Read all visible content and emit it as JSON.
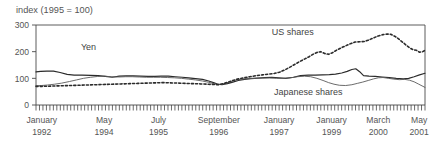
{
  "chart_data": {
    "type": "line",
    "title": "index (1995 = 100)",
    "xlabel": "",
    "ylabel": "",
    "ylim": [
      0,
      300
    ],
    "yticks": [
      0,
      100,
      200,
      300
    ],
    "ytick_labels": [
      "0",
      "100",
      "200",
      "300"
    ],
    "grid": false,
    "legend_position": "inline-annotations",
    "x_tick_labels": [
      {
        "month": "January",
        "year": "1992",
        "pos": 0.015
      },
      {
        "month": "May",
        "year": "1994",
        "pos": 0.175
      },
      {
        "month": "July",
        "year": "1995",
        "pos": 0.315
      },
      {
        "month": "September",
        "year": "1996",
        "pos": 0.47
      },
      {
        "month": "January",
        "year": "1997",
        "pos": 0.625
      },
      {
        "month": "January",
        "year": "1999",
        "pos": 0.76
      },
      {
        "month": "March",
        "year": "2000",
        "pos": 0.88
      },
      {
        "month": "May",
        "year": "2001",
        "pos": 0.985
      }
    ],
    "minor_tick_count": 113,
    "annotations": [
      {
        "text": "Yen",
        "x_frac": 0.135,
        "y_value": 205
      },
      {
        "text": "US shares",
        "x_frac": 0.66,
        "y_value": 262
      },
      {
        "text": "Japanese shares",
        "x_frac": 0.7,
        "y_value": 38
      }
    ],
    "series": [
      {
        "name": "Yen",
        "style": "solid",
        "color": "#2b2b2b",
        "width": 1.2,
        "values": [
          [
            0.0,
            124
          ],
          [
            0.012,
            126
          ],
          [
            0.028,
            127
          ],
          [
            0.045,
            127
          ],
          [
            0.062,
            122
          ],
          [
            0.08,
            115
          ],
          [
            0.098,
            112
          ],
          [
            0.118,
            112
          ],
          [
            0.14,
            111
          ],
          [
            0.16,
            110
          ],
          [
            0.178,
            107
          ],
          [
            0.196,
            104
          ],
          [
            0.214,
            108
          ],
          [
            0.232,
            109
          ],
          [
            0.25,
            109
          ],
          [
            0.268,
            108
          ],
          [
            0.288,
            107
          ],
          [
            0.306,
            107
          ],
          [
            0.322,
            108
          ],
          [
            0.34,
            108
          ],
          [
            0.358,
            106
          ],
          [
            0.376,
            104
          ],
          [
            0.392,
            102
          ],
          [
            0.41,
            99
          ],
          [
            0.428,
            96
          ],
          [
            0.444,
            90
          ],
          [
            0.458,
            83
          ],
          [
            0.468,
            78
          ],
          [
            0.478,
            76
          ],
          [
            0.492,
            80
          ],
          [
            0.506,
            86
          ],
          [
            0.52,
            92
          ],
          [
            0.536,
            96
          ],
          [
            0.552,
            99
          ],
          [
            0.57,
            101
          ],
          [
            0.588,
            103
          ],
          [
            0.606,
            104
          ],
          [
            0.624,
            102
          ],
          [
            0.642,
            100
          ],
          [
            0.662,
            104
          ],
          [
            0.68,
            110
          ],
          [
            0.7,
            112
          ],
          [
            0.718,
            112
          ],
          [
            0.736,
            113
          ],
          [
            0.754,
            114
          ],
          [
            0.77,
            116
          ],
          [
            0.786,
            120
          ],
          [
            0.8,
            126
          ],
          [
            0.812,
            133
          ],
          [
            0.822,
            136
          ],
          [
            0.832,
            125
          ],
          [
            0.842,
            110
          ],
          [
            0.856,
            108
          ],
          [
            0.872,
            107
          ],
          [
            0.89,
            105
          ],
          [
            0.908,
            103
          ],
          [
            0.926,
            100
          ],
          [
            0.944,
            98
          ],
          [
            0.958,
            100
          ],
          [
            0.972,
            106
          ],
          [
            0.986,
            113
          ],
          [
            1.0,
            119
          ]
        ]
      },
      {
        "name": "Japanese shares",
        "style": "solid",
        "color": "#5a5a5a",
        "width": 0.9,
        "values": [
          [
            0.0,
            72
          ],
          [
            0.014,
            73
          ],
          [
            0.03,
            75
          ],
          [
            0.048,
            78
          ],
          [
            0.066,
            82
          ],
          [
            0.086,
            88
          ],
          [
            0.104,
            94
          ],
          [
            0.122,
            100
          ],
          [
            0.14,
            104
          ],
          [
            0.158,
            107
          ],
          [
            0.176,
            108
          ],
          [
            0.194,
            106
          ],
          [
            0.212,
            105
          ],
          [
            0.23,
            106
          ],
          [
            0.248,
            106
          ],
          [
            0.266,
            105
          ],
          [
            0.284,
            104
          ],
          [
            0.302,
            104
          ],
          [
            0.32,
            104
          ],
          [
            0.338,
            103
          ],
          [
            0.356,
            102
          ],
          [
            0.374,
            100
          ],
          [
            0.392,
            97
          ],
          [
            0.41,
            94
          ],
          [
            0.428,
            90
          ],
          [
            0.444,
            85
          ],
          [
            0.458,
            80
          ],
          [
            0.468,
            76
          ],
          [
            0.48,
            79
          ],
          [
            0.496,
            86
          ],
          [
            0.512,
            93
          ],
          [
            0.528,
            97
          ],
          [
            0.546,
            99
          ],
          [
            0.564,
            100
          ],
          [
            0.582,
            101
          ],
          [
            0.6,
            101
          ],
          [
            0.618,
            100
          ],
          [
            0.636,
            100
          ],
          [
            0.654,
            102
          ],
          [
            0.672,
            106
          ],
          [
            0.69,
            108
          ],
          [
            0.706,
            106
          ],
          [
            0.722,
            100
          ],
          [
            0.738,
            92
          ],
          [
            0.752,
            84
          ],
          [
            0.766,
            78
          ],
          [
            0.78,
            74
          ],
          [
            0.796,
            73
          ],
          [
            0.812,
            76
          ],
          [
            0.826,
            81
          ],
          [
            0.84,
            86
          ],
          [
            0.854,
            92
          ],
          [
            0.868,
            98
          ],
          [
            0.88,
            102
          ],
          [
            0.892,
            103
          ],
          [
            0.906,
            100
          ],
          [
            0.92,
            97
          ],
          [
            0.934,
            95
          ],
          [
            0.948,
            96
          ],
          [
            0.96,
            93
          ],
          [
            0.972,
            87
          ],
          [
            0.984,
            78
          ],
          [
            1.0,
            66
          ]
        ]
      },
      {
        "name": "US shares",
        "style": "dotted",
        "color": "#2b2b2b",
        "width": 1.6,
        "values": [
          [
            0.0,
            70
          ],
          [
            0.02,
            70
          ],
          [
            0.042,
            71
          ],
          [
            0.064,
            72
          ],
          [
            0.086,
            73
          ],
          [
            0.108,
            74
          ],
          [
            0.13,
            75
          ],
          [
            0.152,
            76
          ],
          [
            0.174,
            77
          ],
          [
            0.196,
            78
          ],
          [
            0.218,
            79
          ],
          [
            0.24,
            80
          ],
          [
            0.262,
            81
          ],
          [
            0.284,
            82
          ],
          [
            0.306,
            83
          ],
          [
            0.326,
            84
          ],
          [
            0.346,
            83
          ],
          [
            0.366,
            82
          ],
          [
            0.386,
            81
          ],
          [
            0.406,
            80
          ],
          [
            0.424,
            79
          ],
          [
            0.44,
            78
          ],
          [
            0.456,
            77
          ],
          [
            0.47,
            76
          ],
          [
            0.486,
            82
          ],
          [
            0.502,
            90
          ],
          [
            0.518,
            97
          ],
          [
            0.534,
            102
          ],
          [
            0.55,
            106
          ],
          [
            0.566,
            110
          ],
          [
            0.582,
            113
          ],
          [
            0.598,
            116
          ],
          [
            0.612,
            118
          ],
          [
            0.626,
            123
          ],
          [
            0.64,
            132
          ],
          [
            0.654,
            143
          ],
          [
            0.666,
            153
          ],
          [
            0.678,
            163
          ],
          [
            0.69,
            172
          ],
          [
            0.702,
            181
          ],
          [
            0.712,
            190
          ],
          [
            0.722,
            197
          ],
          [
            0.732,
            200
          ],
          [
            0.742,
            193
          ],
          [
            0.752,
            190
          ],
          [
            0.762,
            196
          ],
          [
            0.772,
            205
          ],
          [
            0.784,
            214
          ],
          [
            0.796,
            222
          ],
          [
            0.808,
            230
          ],
          [
            0.82,
            236
          ],
          [
            0.832,
            237
          ],
          [
            0.844,
            238
          ],
          [
            0.856,
            244
          ],
          [
            0.868,
            252
          ],
          [
            0.88,
            259
          ],
          [
            0.892,
            264
          ],
          [
            0.902,
            266
          ],
          [
            0.912,
            265
          ],
          [
            0.922,
            258
          ],
          [
            0.932,
            248
          ],
          [
            0.942,
            236
          ],
          [
            0.952,
            224
          ],
          [
            0.962,
            213
          ],
          [
            0.97,
            207
          ],
          [
            0.978,
            205
          ],
          [
            0.986,
            198
          ],
          [
            0.994,
            200
          ],
          [
            1.0,
            205
          ]
        ]
      }
    ]
  },
  "layout": {
    "plot_left": 36,
    "plot_right": 425,
    "plot_top": 25,
    "plot_bottom": 105
  }
}
